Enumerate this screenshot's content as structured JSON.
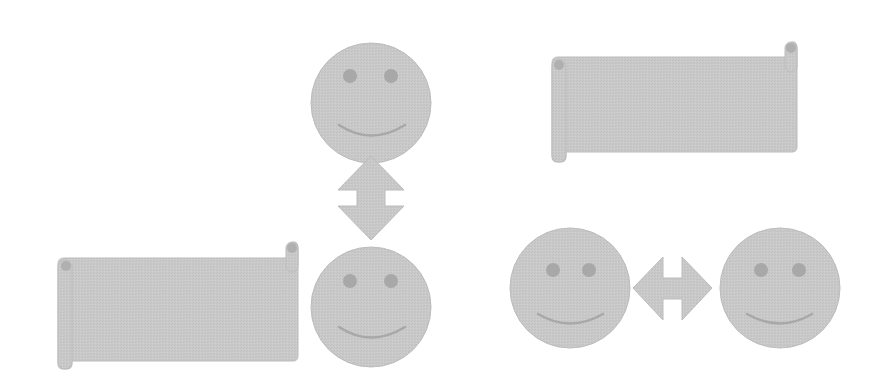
{
  "colors": {
    "fill": "#c8c8c8",
    "stroke": "#b4b4b4",
    "feature": "#a6a6a6",
    "background": "#ffffff"
  },
  "shapes": {
    "smiley_top": {
      "cx": 371,
      "cy": 103,
      "r": 60
    },
    "smiley_bottom_center": {
      "cx": 371,
      "cy": 307,
      "r": 60
    },
    "smiley_bottom_left": {
      "cx": 570,
      "cy": 288,
      "r": 60
    },
    "smiley_bottom_right": {
      "cx": 780,
      "cy": 288,
      "r": 60
    },
    "arrow_vertical": {
      "x": 338,
      "y": 155,
      "w": 66,
      "h": 85
    },
    "arrow_horizontal": {
      "x": 633,
      "y": 257,
      "w": 79,
      "h": 63
    },
    "scroll_left": {
      "x": 56,
      "y": 243,
      "w": 242,
      "h": 119
    },
    "scroll_top_right": {
      "x": 550,
      "y": 40,
      "w": 247,
      "h": 122
    }
  }
}
